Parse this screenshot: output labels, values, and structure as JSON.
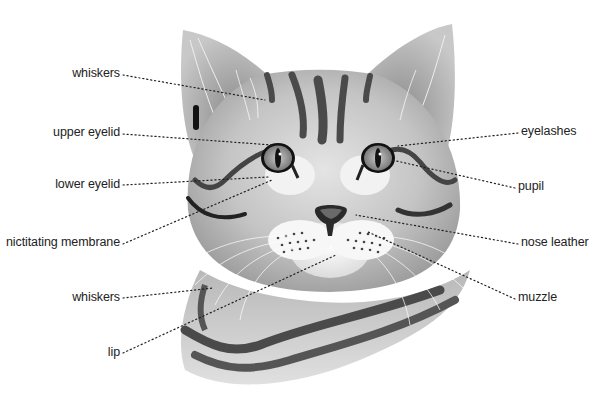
{
  "diagram": {
    "colors": {
      "background": "#ffffff",
      "fur_light": "#d8d8d8",
      "fur_mid": "#a9a9a9",
      "stripe": "#4a4a4a",
      "leader": "#222222",
      "text": "#222222"
    },
    "labels_left": [
      {
        "id": "whiskers-upper",
        "text": "whiskers",
        "x": 120,
        "y": 72,
        "target": [
          265,
          100
        ]
      },
      {
        "id": "upper-eyelid",
        "text": "upper eyelid",
        "x": 120,
        "y": 131,
        "target": [
          272,
          145
        ]
      },
      {
        "id": "lower-eyelid",
        "text": "lower eyelid",
        "x": 120,
        "y": 183,
        "target": [
          268,
          177
        ]
      },
      {
        "id": "nictitating-membrane",
        "text": "nictitating membrane",
        "x": 120,
        "y": 241,
        "target": [
          272,
          180
        ]
      },
      {
        "id": "whiskers-lower",
        "text": "whiskers",
        "x": 120,
        "y": 296,
        "target": [
          213,
          287
        ]
      },
      {
        "id": "lip",
        "text": "lip",
        "x": 120,
        "y": 351,
        "target": [
          336,
          256
        ]
      }
    ],
    "labels_right": [
      {
        "id": "eyelashes",
        "text": "eyelashes",
        "x": 521,
        "y": 130,
        "target": [
          398,
          145
        ]
      },
      {
        "id": "pupil",
        "text": "pupil",
        "x": 518,
        "y": 185,
        "target": [
          392,
          160
        ]
      },
      {
        "id": "nose-leather",
        "text": "nose leather",
        "x": 521,
        "y": 241,
        "target": [
          356,
          215
        ]
      },
      {
        "id": "muzzle",
        "text": "muzzle",
        "x": 518,
        "y": 296,
        "target": [
          368,
          232
        ]
      }
    ]
  }
}
